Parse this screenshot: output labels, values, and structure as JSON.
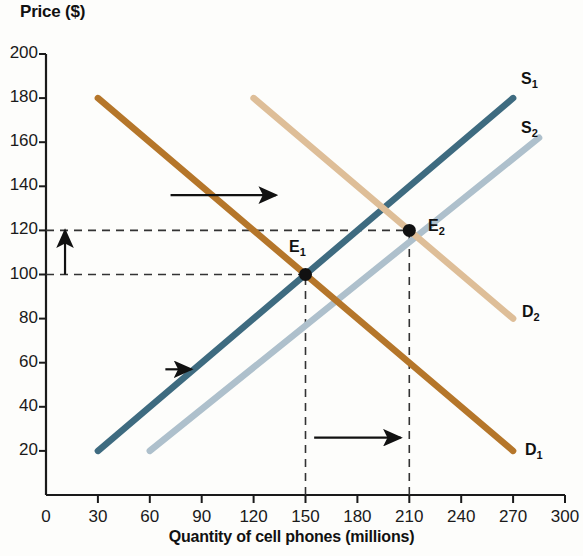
{
  "chart_data": {
    "type": "line",
    "title": "",
    "xlabel": "Quantity of cell phones (millions)",
    "ylabel": "Price ($)",
    "xlim": [
      0,
      300
    ],
    "ylim": [
      0,
      200
    ],
    "grid": false,
    "xticks": [
      0,
      30,
      60,
      90,
      120,
      150,
      180,
      210,
      240,
      270,
      300
    ],
    "yticks": [
      20,
      40,
      60,
      80,
      100,
      120,
      140,
      160,
      180,
      200
    ],
    "series": [
      {
        "name": "S1",
        "label": "S",
        "sub": "1",
        "role": "supply-original",
        "color": "#3E6B80",
        "points": [
          [
            30,
            20
          ],
          [
            270,
            180
          ]
        ]
      },
      {
        "name": "S2",
        "label": "S",
        "sub": "2",
        "role": "supply-shifted",
        "color": "#AEC0CC",
        "points": [
          [
            60,
            20
          ],
          [
            285,
            162
          ]
        ]
      },
      {
        "name": "D1",
        "label": "D",
        "sub": "1",
        "role": "demand-original",
        "color": "#B5762A",
        "points": [
          [
            30,
            180
          ],
          [
            270,
            20
          ]
        ]
      },
      {
        "name": "D2",
        "label": "D",
        "sub": "2",
        "role": "demand-shifted",
        "color": "#DEBE98",
        "points": [
          [
            120,
            180
          ],
          [
            270,
            80
          ]
        ]
      }
    ],
    "points": [
      {
        "name": "E1",
        "label": "E",
        "sub": "1",
        "x": 150,
        "y": 100
      },
      {
        "name": "E2",
        "label": "E",
        "sub": "2",
        "x": 210,
        "y": 120
      }
    ],
    "annotations": [
      {
        "name": "demand-shift-arrow",
        "kind": "arrow",
        "direction": "right",
        "from": [
          72,
          136
        ],
        "to": [
          133,
          136
        ]
      },
      {
        "name": "supply-shift-arrow",
        "kind": "arrow",
        "direction": "right",
        "from": [
          69,
          57
        ],
        "to": [
          84,
          57
        ]
      },
      {
        "name": "price-change-arrow",
        "kind": "arrow",
        "direction": "up",
        "from": [
          11,
          100
        ],
        "to": [
          11,
          120
        ]
      },
      {
        "name": "quantity-change-arrow",
        "kind": "arrow",
        "direction": "right",
        "from": [
          155,
          26
        ],
        "to": [
          205,
          26
        ]
      },
      {
        "name": "price-guide-120",
        "kind": "dashed-horizontal",
        "value": 120,
        "to_x": 210
      },
      {
        "name": "price-guide-100",
        "kind": "dashed-horizontal",
        "value": 100,
        "to_x": 150
      },
      {
        "name": "quantity-guide-150",
        "kind": "dashed-vertical",
        "value": 150,
        "to_y": 100
      },
      {
        "name": "quantity-guide-210",
        "kind": "dashed-vertical",
        "value": 210,
        "to_y": 120
      }
    ]
  },
  "axis": {
    "y_title": "Price ($)",
    "x_title": "Quantity of cell phones (millions)",
    "x_tick_labels": [
      "0",
      "30",
      "60",
      "90",
      "120",
      "150",
      "180",
      "210",
      "240",
      "270",
      "300"
    ],
    "y_tick_labels": [
      "20",
      "40",
      "60",
      "80",
      "100",
      "120",
      "140",
      "160",
      "180",
      "200"
    ]
  },
  "labels": {
    "s1": "S",
    "s1_sub": "1",
    "s2": "S",
    "s2_sub": "2",
    "d1": "D",
    "d1_sub": "1",
    "d2": "D",
    "d2_sub": "2",
    "e1": "E",
    "e1_sub": "1",
    "e2": "E",
    "e2_sub": "2"
  },
  "colors": {
    "supply_original": "#3E6B80",
    "supply_shifted": "#AEC0CC",
    "demand_original": "#B5762A",
    "demand_shifted": "#DEBE98",
    "axis": "#1a1a1a",
    "dashed": "#333333",
    "background": "#fdfdfb"
  }
}
